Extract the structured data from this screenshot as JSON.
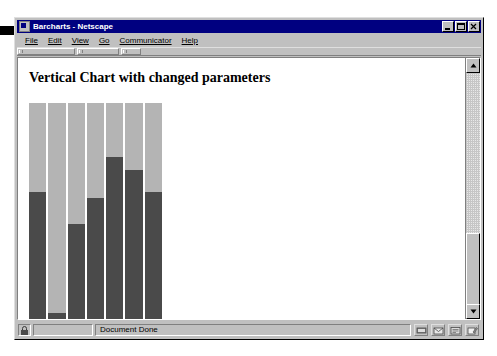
{
  "window": {
    "title": "Barcharts - Netscape",
    "icon": "netscape-document-icon",
    "controls": {
      "minimize": "minimize-button",
      "maximize": "maximize-button",
      "close": "close-button"
    }
  },
  "menu": {
    "items": [
      {
        "label": "File",
        "accel": "F"
      },
      {
        "label": "Edit",
        "accel": "E"
      },
      {
        "label": "View",
        "accel": "V"
      },
      {
        "label": "Go",
        "accel": "G"
      },
      {
        "label": "Communicator",
        "accel": "C"
      },
      {
        "label": "Help",
        "accel": "H"
      }
    ]
  },
  "page": {
    "heading": "Vertical Chart with changed parameters"
  },
  "chart_data": {
    "type": "bar",
    "title": "Vertical Chart with changed parameters",
    "xlabel": "",
    "ylabel": "",
    "categories": [
      "1",
      "2",
      "3",
      "4",
      "5",
      "6",
      "7"
    ],
    "values": [
      59,
      3,
      44,
      56,
      75,
      69,
      59
    ],
    "ylim": [
      0,
      100
    ],
    "grid": false,
    "legend": false,
    "orientation": "vertical",
    "bar_color": "#4a4a4a",
    "track_color": "#b4b4b4",
    "background": "#ffffff"
  },
  "scrollbar": {
    "up_arrow": "scroll-up-arrow",
    "down_arrow": "scroll-down-arrow",
    "thumb_position": "lower"
  },
  "status": {
    "message": "Document Done",
    "left_icon": "security-padlock-icon",
    "right_icons": [
      "online-status-icon",
      "mail-icon",
      "newsgroup-icon",
      "composer-icon"
    ]
  },
  "colors": {
    "title_bar": "#000080",
    "window_face": "#c0c0c0",
    "bar_dark": "#4a4a4a",
    "bar_track": "#b4b4b4"
  }
}
